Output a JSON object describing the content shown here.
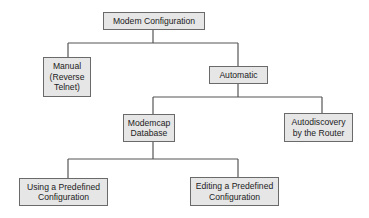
{
  "diagram": {
    "type": "tree",
    "colors": {
      "node_fill": "#e6e6e6",
      "node_border": "#6a6a6a",
      "edge": "#555555",
      "text": "#222222"
    },
    "nodes": {
      "root": {
        "label": "Modem Configuration"
      },
      "manual": {
        "label": "Manual\n(Reverse\nTelnet)"
      },
      "automatic": {
        "label": "Automatic"
      },
      "modemcap": {
        "label": "Modemcap\nDatabase"
      },
      "autodiscovery": {
        "label": "Autodiscovery\nby the Router"
      },
      "using": {
        "label": "Using a Predefined\nConfiguration"
      },
      "editing": {
        "label": "Editing a Predefined\nConfiguration"
      }
    },
    "edges": [
      {
        "from": "Modem Configuration",
        "to": "Manual (Reverse Telnet)"
      },
      {
        "from": "Modem Configuration",
        "to": "Automatic"
      },
      {
        "from": "Automatic",
        "to": "Modemcap Database"
      },
      {
        "from": "Automatic",
        "to": "Autodiscovery by the Router"
      },
      {
        "from": "Modemcap Database",
        "to": "Using a Predefined Configuration"
      },
      {
        "from": "Modemcap Database",
        "to": "Editing a Predefined Configuration"
      }
    ]
  }
}
